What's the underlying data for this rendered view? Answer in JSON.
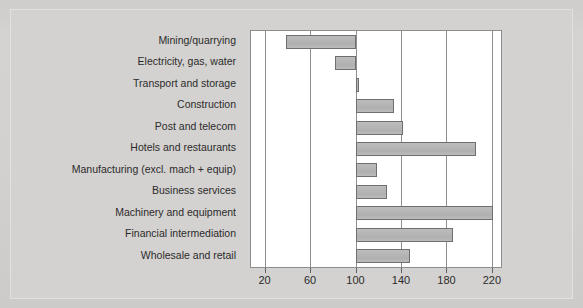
{
  "chart_data": {
    "type": "bar",
    "orientation": "horizontal",
    "title": "",
    "subtitle": "",
    "xlabel": "",
    "ylabel": "",
    "xlim": [
      8,
      228
    ],
    "baseline": 100,
    "grid": true,
    "grid_axis": "x",
    "legend": "none",
    "xticks": [
      20,
      60,
      100,
      140,
      180,
      220
    ],
    "xtick_labels": [
      "20",
      "60",
      "100",
      "140",
      "180",
      "220"
    ],
    "categories": [
      "Mining/quarrying",
      "Electricity, gas, water",
      "Transport and storage",
      "Construction",
      "Post and telecom",
      "Hotels and restaurants",
      "Manufacturing (excl. mach + equip)",
      "Business services",
      "Machinery and equipment",
      "Financial intermediation",
      "Wholesale and retail"
    ],
    "values": [
      39,
      82,
      103,
      134,
      142,
      206,
      119,
      128,
      221,
      186,
      148
    ],
    "bar_fill": "#b5b5b5",
    "bar_edge": "#6f6f6f",
    "plot_background": "#ffffff",
    "page_background": "#d4d2d0",
    "gridline_color": "#8f8f8f"
  }
}
